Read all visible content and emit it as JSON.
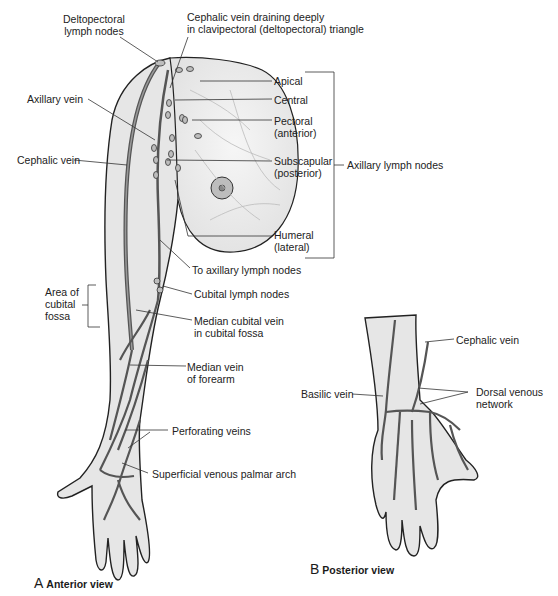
{
  "figure": {
    "panels": [
      {
        "letter": "A",
        "title": "Anterior view"
      },
      {
        "letter": "B",
        "title": "Posterior view"
      }
    ],
    "colors": {
      "skin": "#e4e4e4",
      "skin_light": "#efefef",
      "vein": "#5a5a5a",
      "outline": "#222222",
      "leader": "#333333"
    }
  },
  "labels": {
    "deltopectoral": "Deltopectoral\nlymph nodes",
    "cephalic_deep": "Cephalic vein draining deeply\nin clavipectoral (deltopectoral) triangle",
    "apical": "Apical",
    "central": "Central",
    "pectoral": "Pectoral\n(anterior)",
    "subscapular": "Subscapular\n(posterior)",
    "axillary_nodes": "Axillary lymph nodes",
    "axillary_vein": "Axillary vein",
    "cephalic_vein_a": "Cephalic vein",
    "humeral": "Humeral\n(lateral)",
    "to_axillary": "To axillary lymph nodes",
    "cubital_fossa": "Area of\ncubital\nfossa",
    "cubital_nodes": "Cubital lymph nodes",
    "median_cubital": "Median cubital vein\nin cubital fossa",
    "median_forearm": "Median vein\nof forearm",
    "perforating": "Perforating veins",
    "palmar_arch": "Superficial venous palmar arch",
    "cephalic_vein_b": "Cephalic vein",
    "basilic_vein": "Basilic vein",
    "dorsal_network": "Dorsal venous\nnetwork"
  }
}
